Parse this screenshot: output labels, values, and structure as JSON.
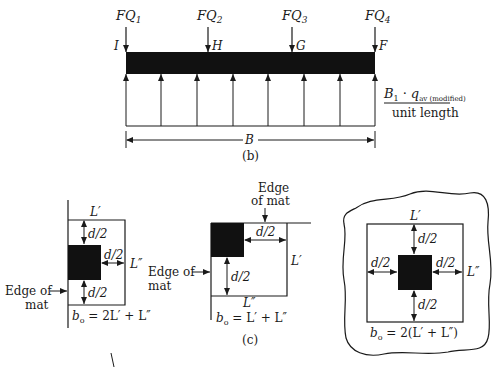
{
  "figure": {
    "part_b": {
      "caption": "(b)",
      "loads": [
        {
          "label": "FQ",
          "sub": "1",
          "point": "I"
        },
        {
          "label": "FQ",
          "sub": "2",
          "point": "H"
        },
        {
          "label": "FQ",
          "sub": "3",
          "point": "G"
        },
        {
          "label": "FQ",
          "sub": "4",
          "point": "F"
        }
      ],
      "pressure_label": {
        "numerator_main": "B",
        "numerator_sub": "1",
        "dot": "·",
        "q": "q",
        "q_sub": "av (modified)",
        "denominator": "unit length"
      },
      "dimension": "B"
    },
    "part_c": {
      "caption": "(c)",
      "edge_column": {
        "edge_label_1": "Edge of",
        "edge_label_2": "mat",
        "L1": "L′",
        "L2": "L″",
        "d_top": "d/2",
        "d_right": "d/2",
        "d_bottom": "d/2",
        "formula_b": "b",
        "formula_sub": "o",
        "formula_rest": " = 2L′ + L″"
      },
      "corner_column": {
        "edge_top_1": "Edge",
        "edge_top_2": "of mat",
        "edge_left_1": "Edge of",
        "edge_left_2": "mat",
        "d_right": "d/2",
        "d_bottom": "d/2",
        "L1": "L′",
        "L2": "L″",
        "formula_b": "b",
        "formula_sub": "o",
        "formula_rest": " = L′ + L″"
      },
      "interior_column": {
        "L1": "L′",
        "L2": "L″",
        "d_top": "d/2",
        "d_left": "d/2",
        "d_right": "d/2",
        "d_bottom": "d/2",
        "formula_b": "b",
        "formula_sub": "o",
        "formula_rest": " = 2(L′ + L″)"
      }
    }
  }
}
